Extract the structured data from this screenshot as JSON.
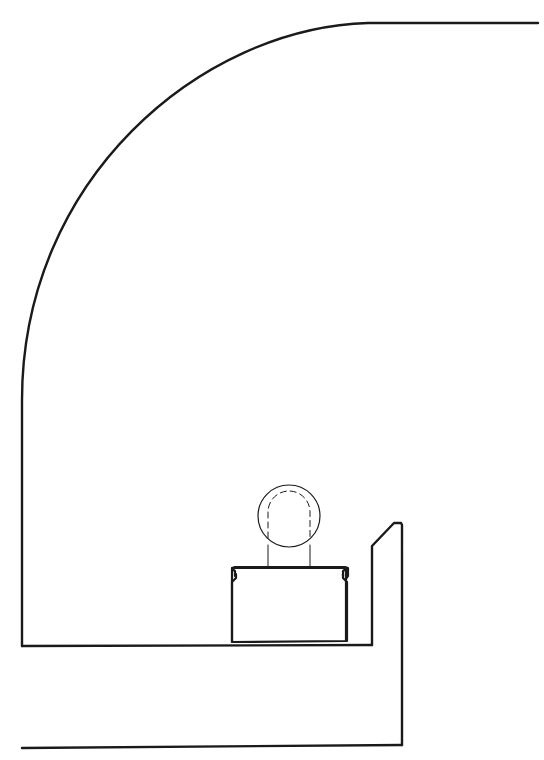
{
  "diagram": {
    "type": "technical line drawing",
    "text_labels": [],
    "stroke_color": "#1a1a1a",
    "background": "#ffffff",
    "elements": [
      {
        "name": "curved-housing-outline",
        "description": "top horizontal line with quarter-round curve down to left vertical wall"
      },
      {
        "name": "floor-line",
        "description": "horizontal base line of housing"
      },
      {
        "name": "bottom-line",
        "description": "lower horizontal line joined to right vertical wall"
      },
      {
        "name": "right-flange",
        "description": "vertical wall with chamfered top"
      },
      {
        "name": "cable-duct",
        "description": "rectangular trough with lipped top edges"
      },
      {
        "name": "round-element",
        "description": "circle with dashed inner outline on vertical stems"
      }
    ]
  }
}
